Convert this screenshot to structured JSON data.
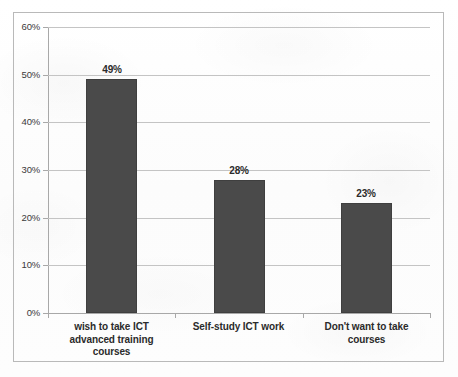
{
  "chart_data": {
    "type": "bar",
    "title": "",
    "subtitle": "",
    "xlabel": "",
    "ylabel": "",
    "categories": [
      "wish to take ICT advanced training courses",
      "Self-study ICT work",
      "Don't want to take courses"
    ],
    "category_lines": [
      [
        "wish to take ICT",
        "advanced training",
        "courses"
      ],
      [
        "Self-study ICT work"
      ],
      [
        "Don't want to take",
        "courses"
      ]
    ],
    "values": [
      49,
      28,
      23
    ],
    "value_labels": [
      "49%",
      "28%",
      "23%"
    ],
    "ylim": [
      0,
      60
    ],
    "ytick_values": [
      0,
      10,
      20,
      30,
      40,
      50,
      60
    ],
    "ytick_labels": [
      "0%",
      "10%",
      "20%",
      "30%",
      "40%",
      "50%",
      "60%"
    ],
    "grid": true,
    "legend": false,
    "legend_position": "none",
    "series": [
      {
        "name": "",
        "values": [
          49,
          28,
          23
        ],
        "color": "#4a4a4a"
      }
    ]
  },
  "style": {
    "bar_color": "#4a4a4a",
    "bar_border_color": "#3f3f3f",
    "gridline_color": "#c4c4c4",
    "axis_color": "#a8a8a8",
    "frame_color": "#b9b9b9",
    "text_color": "#2b2b2b",
    "background": "#fdfdfd"
  }
}
